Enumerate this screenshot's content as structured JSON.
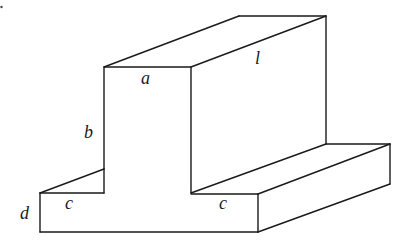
{
  "figure": {
    "type": "isometric-solid",
    "labels": {
      "a": "a",
      "b": "b",
      "c_left": "c",
      "c_right": "c",
      "d": "d",
      "l": "l"
    },
    "colors": {
      "line": "#1a1a1a",
      "background": "#ffffff"
    }
  }
}
